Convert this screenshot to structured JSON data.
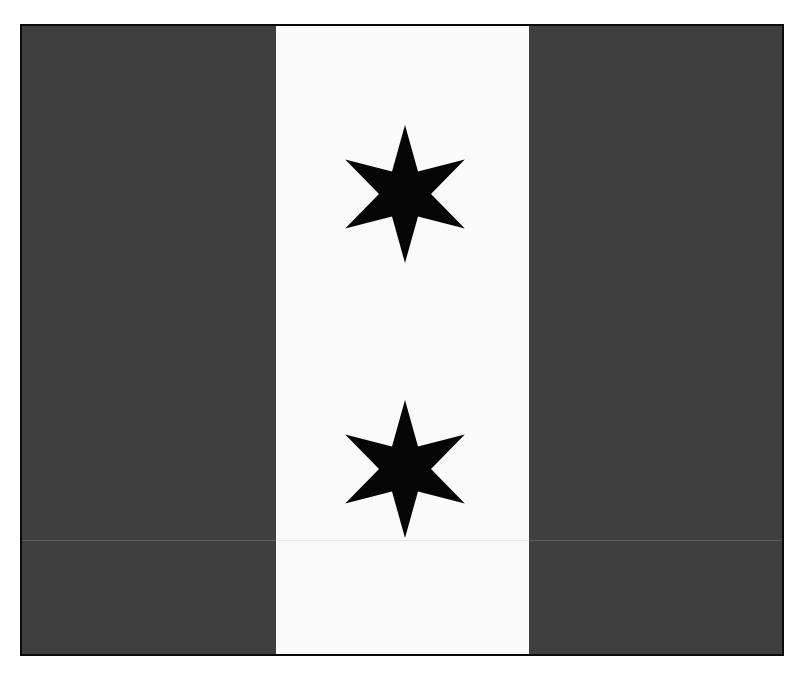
{
  "image": {
    "description": "Flag with three vertical stripes (dark gray, white, dark gray) and two black six-pointed stars on the central white stripe",
    "colors": {
      "background": "#ffffff",
      "border": "#0a0a0a",
      "side_stripes": "#3f3f3f",
      "center_stripe": "#fafafa",
      "stars": "#050505"
    },
    "stripes": [
      {
        "name": "left",
        "color": "#3f3f3f"
      },
      {
        "name": "center",
        "color": "#fafafa"
      },
      {
        "name": "right",
        "color": "#3f3f3f"
      }
    ],
    "stars": [
      {
        "points": 6,
        "center_x": 383,
        "center_y": 168,
        "outer_radius": 69,
        "inner_radius": 26
      },
      {
        "points": 6,
        "center_x": 383,
        "center_y": 443,
        "outer_radius": 69,
        "inner_radius": 26
      }
    ]
  }
}
